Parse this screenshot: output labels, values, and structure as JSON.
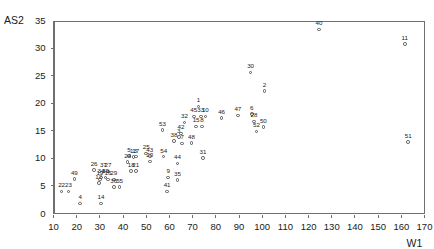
{
  "chart_data": {
    "type": "scatter",
    "title": "",
    "xlabel": "W1",
    "ylabel": "AS2",
    "xlim": [
      10,
      170
    ],
    "ylim": [
      0,
      35
    ],
    "xticks": [
      10,
      20,
      30,
      40,
      50,
      60,
      70,
      80,
      90,
      100,
      110,
      120,
      130,
      140,
      150,
      160,
      170
    ],
    "yticks": [
      0,
      5,
      10,
      15,
      20,
      25,
      30,
      35
    ],
    "grid": false,
    "legend": null,
    "marker": "open-circle",
    "point_label_position": "above",
    "points": [
      {
        "label": "1",
        "x": 72.5,
        "y": 19.4
      },
      {
        "label": "2",
        "x": 101.0,
        "y": 22.2
      },
      {
        "label": "3",
        "x": 64.0,
        "y": 13.9
      },
      {
        "label": "4",
        "x": 21.5,
        "y": 1.8
      },
      {
        "label": "5",
        "x": 42.5,
        "y": 10.4
      },
      {
        "label": "6",
        "x": 95.5,
        "y": 18.0
      },
      {
        "label": "7",
        "x": 65.5,
        "y": 12.7
      },
      {
        "label": "8",
        "x": 74.0,
        "y": 15.8
      },
      {
        "label": "9",
        "x": 59.5,
        "y": 6.5
      },
      {
        "label": "10",
        "x": 75.5,
        "y": 17.6
      },
      {
        "label": "11",
        "x": 161.5,
        "y": 30.7
      },
      {
        "label": "12",
        "x": 29.5,
        "y": 5.5
      },
      {
        "label": "13",
        "x": 44.5,
        "y": 10.2
      },
      {
        "label": "14",
        "x": 30.5,
        "y": 1.8
      },
      {
        "label": "15",
        "x": 71.5,
        "y": 15.8
      },
      {
        "label": "16",
        "x": 33.5,
        "y": 6.2
      },
      {
        "label": "17",
        "x": 45.5,
        "y": 10.3
      },
      {
        "label": "18",
        "x": 43.5,
        "y": 7.7
      },
      {
        "label": "19",
        "x": 30.0,
        "y": 6.2
      },
      {
        "label": "20",
        "x": 51.5,
        "y": 9.4
      },
      {
        "label": "21",
        "x": 45.5,
        "y": 7.7
      },
      {
        "label": "22",
        "x": 13.5,
        "y": 4.0
      },
      {
        "label": "23",
        "x": 16.5,
        "y": 4.0
      },
      {
        "label": "24",
        "x": 42.0,
        "y": 9.3
      },
      {
        "label": "25",
        "x": 50.0,
        "y": 10.9
      },
      {
        "label": "26",
        "x": 27.5,
        "y": 7.9
      },
      {
        "label": "27",
        "x": 33.5,
        "y": 7.6
      },
      {
        "label": "28",
        "x": 96.5,
        "y": 16.7
      },
      {
        "label": "29",
        "x": 36.0,
        "y": 6.2
      },
      {
        "label": "30",
        "x": 95.0,
        "y": 25.6
      },
      {
        "label": "31",
        "x": 74.5,
        "y": 10.1
      },
      {
        "label": "32",
        "x": 66.5,
        "y": 16.5
      },
      {
        "label": "33",
        "x": 73.5,
        "y": 17.6
      },
      {
        "label": "34",
        "x": 30.5,
        "y": 6.5
      },
      {
        "label": "35",
        "x": 63.5,
        "y": 6.1
      },
      {
        "label": "36",
        "x": 36.0,
        "y": 4.8
      },
      {
        "label": "37",
        "x": 31.5,
        "y": 7.6
      },
      {
        "label": "38",
        "x": 62.0,
        "y": 13.1
      },
      {
        "label": "39",
        "x": 32.5,
        "y": 6.5
      },
      {
        "label": "40",
        "x": 124.5,
        "y": 33.4
      },
      {
        "label": "41",
        "x": 59.0,
        "y": 4.0
      },
      {
        "label": "42",
        "x": 65.0,
        "y": 14.5
      },
      {
        "label": "43",
        "x": 51.5,
        "y": 10.4
      },
      {
        "label": "44",
        "x": 63.5,
        "y": 9.1
      },
      {
        "label": "45",
        "x": 70.5,
        "y": 17.6
      },
      {
        "label": "46",
        "x": 82.5,
        "y": 17.3
      },
      {
        "label": "47",
        "x": 89.5,
        "y": 17.8
      },
      {
        "label": "48",
        "x": 69.5,
        "y": 12.8
      },
      {
        "label": "49",
        "x": 19.0,
        "y": 6.3
      },
      {
        "label": "50",
        "x": 100.5,
        "y": 15.7
      },
      {
        "label": "51",
        "x": 163.0,
        "y": 13.0
      },
      {
        "label": "52",
        "x": 97.5,
        "y": 14.9
      },
      {
        "label": "53",
        "x": 57.0,
        "y": 15.1
      },
      {
        "label": "54",
        "x": 57.5,
        "y": 10.3
      },
      {
        "label": "55",
        "x": 38.5,
        "y": 4.8
      }
    ]
  }
}
